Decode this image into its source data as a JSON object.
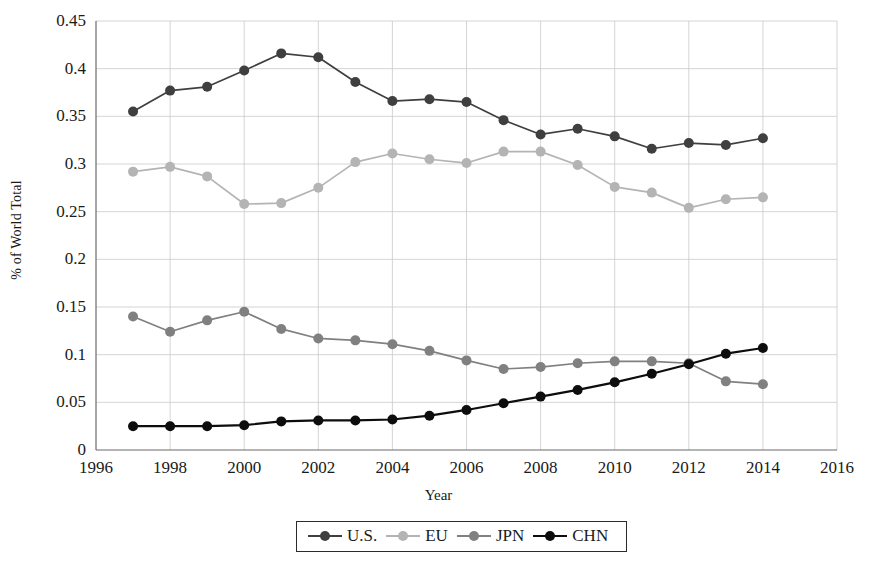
{
  "chart_data": {
    "type": "line",
    "title": "",
    "xlabel": "Year",
    "ylabel": "% of World Total",
    "xlim": [
      1996,
      2016
    ],
    "ylim": [
      0,
      0.45
    ],
    "xticks": [
      "1996",
      "1998",
      "2000",
      "2002",
      "2004",
      "2006",
      "2008",
      "2010",
      "2012",
      "2014",
      "2016"
    ],
    "yticks": [
      "0",
      "0.05",
      "0.1",
      "0.15",
      "0.2",
      "0.25",
      "0.3",
      "0.35",
      "0.4",
      "0.45"
    ],
    "grid": true,
    "legend_position": "bottom",
    "x": [
      1997,
      1998,
      1999,
      2000,
      2001,
      2002,
      2003,
      2004,
      2005,
      2006,
      2007,
      2008,
      2009,
      2010,
      2011,
      2012,
      2013,
      2014
    ],
    "series": [
      {
        "name": "U.S.",
        "color": "#3f3f3f",
        "values": [
          0.355,
          0.377,
          0.381,
          0.398,
          0.416,
          0.412,
          0.386,
          0.366,
          0.368,
          0.365,
          0.346,
          0.331,
          0.337,
          0.329,
          0.316,
          0.322,
          0.32,
          0.327
        ]
      },
      {
        "name": "EU",
        "color": "#b4b4b4",
        "values": [
          0.292,
          0.297,
          0.287,
          0.258,
          0.259,
          0.275,
          0.302,
          0.311,
          0.305,
          0.301,
          0.313,
          0.313,
          0.299,
          0.276,
          0.27,
          0.254,
          0.263,
          0.265
        ]
      },
      {
        "name": "JPN",
        "color": "#808080",
        "values": [
          0.14,
          0.124,
          0.136,
          0.145,
          0.127,
          0.117,
          0.115,
          0.111,
          0.104,
          0.094,
          0.085,
          0.087,
          0.091,
          0.093,
          0.093,
          0.091,
          0.072,
          0.069
        ]
      },
      {
        "name": "CHN",
        "color": "#0d0d0d",
        "values": [
          0.025,
          0.025,
          0.025,
          0.026,
          0.03,
          0.031,
          0.031,
          0.032,
          0.036,
          0.042,
          0.049,
          0.056,
          0.063,
          0.071,
          0.08,
          0.09,
          0.101,
          0.107
        ]
      }
    ]
  },
  "axes": {
    "x_title": "Year",
    "y_title": "% of World Total"
  },
  "legend": {
    "items": [
      {
        "label": "U.S.",
        "color": "#3f3f3f"
      },
      {
        "label": "EU",
        "color": "#b4b4b4"
      },
      {
        "label": "JPN",
        "color": "#808080"
      },
      {
        "label": "CHN",
        "color": "#0d0d0d"
      }
    ]
  }
}
